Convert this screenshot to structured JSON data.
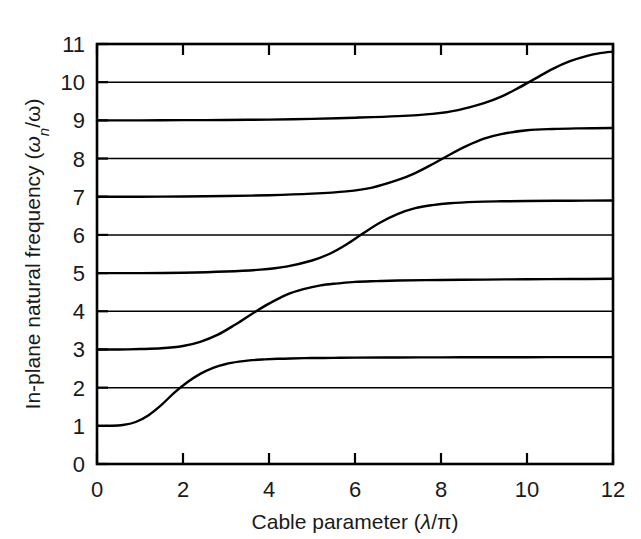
{
  "chart_data": {
    "type": "line",
    "title": "",
    "xlabel": "Cable parameter (λ/π)",
    "ylabel": "In-plane natural frequency (ωn/ω)",
    "xlim": [
      0,
      12
    ],
    "ylim": [
      0,
      11
    ],
    "xticks": [
      0,
      2,
      4,
      6,
      8,
      10,
      12
    ],
    "yticks": [
      0,
      1,
      2,
      3,
      4,
      5,
      6,
      7,
      8,
      9,
      10,
      11
    ],
    "grid": false,
    "legend": null,
    "line_color": "#000000",
    "reference_lines": {
      "description": "horizontal lines at even integers spanning full width",
      "values": [
        2,
        4,
        6,
        8,
        10
      ]
    },
    "series": [
      {
        "name": "mode-1",
        "start_value": 1,
        "end_value": 2.8,
        "transition_center": 1.9,
        "x": [
          0,
          0.3,
          0.6,
          0.9,
          1.2,
          1.5,
          1.8,
          2.1,
          2.4,
          2.7,
          3.0,
          3.3,
          3.6,
          3.9,
          4.2,
          4.5,
          5.0,
          5.5,
          6.0,
          7.0,
          8.0,
          9.0,
          10.0,
          11.0,
          12.0
        ],
        "y": [
          1.0,
          1.0,
          1.02,
          1.1,
          1.28,
          1.55,
          1.87,
          2.14,
          2.36,
          2.52,
          2.62,
          2.68,
          2.72,
          2.74,
          2.755,
          2.765,
          2.775,
          2.78,
          2.785,
          2.79,
          2.793,
          2.795,
          2.797,
          2.799,
          2.8
        ]
      },
      {
        "name": "mode-2",
        "start_value": 3,
        "end_value": 4.85,
        "transition_center": 3.9,
        "x": [
          0,
          0.5,
          1.0,
          1.5,
          2.0,
          2.4,
          2.8,
          3.2,
          3.6,
          4.0,
          4.4,
          4.8,
          5.2,
          5.6,
          6.0,
          6.5,
          7.0,
          8.0,
          9.0,
          10.0,
          11.0,
          12.0
        ],
        "y": [
          3.0,
          3.0,
          3.01,
          3.03,
          3.09,
          3.2,
          3.38,
          3.64,
          3.93,
          4.2,
          4.43,
          4.58,
          4.68,
          4.73,
          4.77,
          4.79,
          4.805,
          4.82,
          4.83,
          4.838,
          4.845,
          4.85
        ]
      },
      {
        "name": "mode-3",
        "start_value": 5,
        "end_value": 6.9,
        "transition_center": 6.0,
        "x": [
          0,
          1.0,
          2.0,
          3.0,
          3.8,
          4.4,
          5.0,
          5.4,
          5.8,
          6.2,
          6.6,
          7.0,
          7.4,
          7.8,
          8.2,
          8.8,
          9.4,
          10.0,
          11.0,
          12.0
        ],
        "y": [
          5.0,
          5.0,
          5.01,
          5.04,
          5.09,
          5.17,
          5.33,
          5.5,
          5.75,
          6.05,
          6.33,
          6.55,
          6.7,
          6.78,
          6.83,
          6.865,
          6.88,
          6.888,
          6.895,
          6.9
        ]
      },
      {
        "name": "mode-4",
        "start_value": 7,
        "end_value": 8.8,
        "transition_center": 8.05,
        "x": [
          0,
          1.0,
          2.0,
          3.0,
          4.0,
          5.0,
          5.8,
          6.4,
          7.0,
          7.4,
          7.8,
          8.2,
          8.6,
          9.0,
          9.4,
          10.0,
          10.6,
          11.2,
          12.0
        ],
        "y": [
          7.0,
          7.0,
          7.005,
          7.02,
          7.04,
          7.08,
          7.14,
          7.24,
          7.44,
          7.62,
          7.85,
          8.1,
          8.33,
          8.52,
          8.64,
          8.74,
          8.775,
          8.79,
          8.8
        ]
      },
      {
        "name": "mode-5",
        "start_value": 9,
        "end_value": 10.8,
        "transition_center": 10.1,
        "x": [
          0,
          1.0,
          2.0,
          3.0,
          4.0,
          5.0,
          6.0,
          7.0,
          7.8,
          8.4,
          9.0,
          9.4,
          9.8,
          10.2,
          10.6,
          11.0,
          11.4,
          11.7,
          12.0
        ],
        "y": [
          9.0,
          9.0,
          9.005,
          9.01,
          9.02,
          9.04,
          9.07,
          9.11,
          9.17,
          9.27,
          9.45,
          9.62,
          9.85,
          10.1,
          10.35,
          10.55,
          10.69,
          10.76,
          10.8
        ]
      }
    ]
  },
  "axes": {
    "y_title_prefix": "In-plane natural frequency (",
    "y_title_omega": "ω",
    "y_title_sub": "n",
    "y_title_mid": "/",
    "y_title_omega2": "ω",
    "y_title_suffix": ")",
    "x_title_prefix": "Cable parameter (",
    "x_title_lambda": "λ",
    "x_title_slash": "/",
    "x_title_pi": "π",
    "x_title_suffix": ")"
  },
  "ticks": {
    "y_labels": [
      "11",
      "10",
      "9",
      "8",
      "7",
      "6",
      "5",
      "4",
      "3",
      "2",
      "1",
      "0"
    ],
    "x_labels": [
      "0",
      "2",
      "4",
      "6",
      "8",
      "10",
      "12"
    ]
  }
}
